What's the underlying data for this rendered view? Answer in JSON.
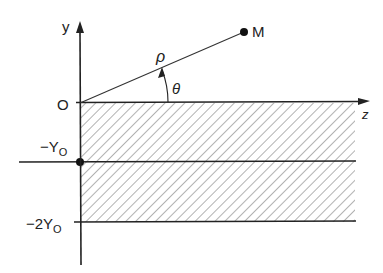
{
  "diagram": {
    "type": "coordinate-geometry",
    "labels": {
      "y_axis": "y",
      "z_axis": "z",
      "origin": "O",
      "point": "M",
      "radius": "ρ",
      "angle": "θ",
      "level1": "−Y",
      "level1_sub": "O",
      "level2": "−2Y",
      "level2_sub": "O"
    },
    "colors": {
      "line": "#222222",
      "hatch": "#555555",
      "background": "#ffffff"
    }
  }
}
